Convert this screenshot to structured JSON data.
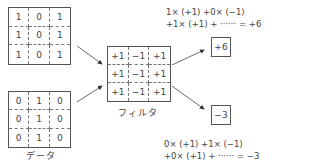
{
  "data_grids": {
    "label": "データ",
    "top": {
      "cells": [
        [
          "1",
          "0",
          "1"
        ],
        [
          "1",
          "0",
          "1"
        ],
        [
          "1",
          "0",
          "1"
        ]
      ]
    },
    "bottom": {
      "cells": [
        [
          "0",
          "1",
          "0"
        ],
        [
          "0",
          "1",
          "0"
        ],
        [
          "0",
          "1",
          "0"
        ]
      ]
    }
  },
  "filter": {
    "label": "フィルタ",
    "cells": [
      [
        "+1",
        "−1",
        "+1"
      ],
      [
        "+1",
        "−1",
        "+1"
      ],
      [
        "+1",
        "−1",
        "+1"
      ]
    ]
  },
  "results": {
    "top": {
      "value": "+6",
      "formula_line1": "1× (+1) +0× (−1)",
      "formula_line2": "+1× (+1) + ······ = +6"
    },
    "bottom": {
      "value": "−3",
      "formula_line1": "0× (+1) +1× (−1)",
      "formula_line2": "+0× (+1) + ······ = −3"
    }
  },
  "colors": {
    "line": "#555555",
    "text": "#444444",
    "background": "#ffffff"
  }
}
